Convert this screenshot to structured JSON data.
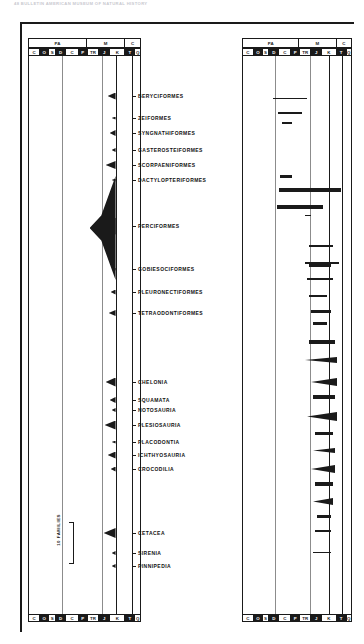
{
  "running_head": "48  BULLETIN AMERICAN MUSEUM OF NATURAL HISTORY",
  "scale_key": {
    "label": "10 FAMILIES"
  },
  "eras": [
    {
      "code": "PALEOZOIC",
      "short": "PA",
      "w": 46
    },
    {
      "code": "MESOZOIC",
      "short": "M",
      "w": 30
    },
    {
      "code": "CENOZOIC",
      "short": "C",
      "w": 12
    }
  ],
  "periods": [
    {
      "code": "C",
      "name": "Cambrian",
      "dark": false,
      "w": 9
    },
    {
      "code": "O",
      "name": "Ordovician",
      "dark": true,
      "w": 7
    },
    {
      "code": "S",
      "name": "Silurian",
      "dark": false,
      "w": 5
    },
    {
      "code": "D",
      "name": "Devonian",
      "dark": true,
      "w": 8
    },
    {
      "code": "C",
      "name": "Carboniferous",
      "dark": false,
      "w": 10
    },
    {
      "code": "P",
      "name": "Permian",
      "dark": true,
      "w": 7
    },
    {
      "code": "TR",
      "name": "Triassic",
      "dark": false,
      "w": 9
    },
    {
      "code": "J",
      "name": "Jurassic",
      "dark": true,
      "w": 9
    },
    {
      "code": "K",
      "name": "Cretaceous",
      "dark": false,
      "w": 12
    },
    {
      "code": "T",
      "name": "Tertiary",
      "dark": true,
      "w": 8
    },
    {
      "code": "Q",
      "name": "Quaternary",
      "dark": false,
      "w": 4
    }
  ],
  "chart_data": {
    "type": "area",
    "xlabel": "Geologic time (Cambrian – Quaternary)",
    "ylabel": "Taxonomic orders",
    "grid": false,
    "legend": "none",
    "units": "families",
    "scale_bar_families": 10,
    "panels": [
      {
        "name": "left-panel",
        "groups": [
          {
            "label": "BERYCIFORMES",
            "y": 96,
            "peak_families": 9,
            "start": "K",
            "end": "Q"
          },
          {
            "label": "ZEIFORMES",
            "y": 118,
            "peak_families": 2,
            "start": "K",
            "end": "Q"
          },
          {
            "label": "SYNGNATHIFORMES",
            "y": 133,
            "peak_families": 7,
            "start": "T",
            "end": "Q"
          },
          {
            "label": "GASTEROSTEIFORMES",
            "y": 150,
            "peak_families": 3,
            "start": "T",
            "end": "Q"
          },
          {
            "label": "SCORPAENIFORMES",
            "y": 165,
            "peak_families": 11,
            "start": "T",
            "end": "Q"
          },
          {
            "label": "DACTYLOPTERIFORMES",
            "y": 180,
            "peak_families": 2,
            "start": "T",
            "end": "Q"
          },
          {
            "label": "PERCIFORMES",
            "y": 226,
            "peak_families": 28,
            "start": "K",
            "end": "Q"
          },
          {
            "label": "GOBIESOCIFORMES",
            "y": 269,
            "peak_families": 2,
            "start": "T",
            "end": "Q"
          },
          {
            "label": "PLEURONECTIFORMES",
            "y": 292,
            "peak_families": 6,
            "start": "T",
            "end": "Q"
          },
          {
            "label": "TETRAODONTIFORMES",
            "y": 313,
            "peak_families": 8,
            "start": "T",
            "end": "Q"
          },
          {
            "label": "CHELONIA",
            "y": 382,
            "peak_families": 12,
            "start": "TR",
            "end": "Q"
          },
          {
            "label": "SQUAMATA",
            "y": 400,
            "peak_families": 7,
            "start": "J",
            "end": "Q"
          },
          {
            "label": "NOTOSAURIA",
            "y": 410,
            "peak_families": 3,
            "start": "TR",
            "end": "TR"
          },
          {
            "label": "PLESIOSAURIA",
            "y": 425,
            "peak_families": 13,
            "start": "TR",
            "end": "K"
          },
          {
            "label": "PLACODONTIA",
            "y": 442,
            "peak_families": 2,
            "start": "TR",
            "end": "TR"
          },
          {
            "label": "ICHTHYOSAURIA",
            "y": 455,
            "peak_families": 9,
            "start": "TR",
            "end": "K"
          },
          {
            "label": "CROCODILIA",
            "y": 469,
            "peak_families": 6,
            "start": "TR",
            "end": "Q"
          },
          {
            "label": "CETACEA",
            "y": 533,
            "peak_families": 14,
            "start": "T",
            "end": "Q"
          },
          {
            "label": "SIRENIA",
            "y": 553,
            "peak_families": 4,
            "start": "T",
            "end": "Q"
          },
          {
            "label": "PINNIPEDIA",
            "y": 566,
            "peak_families": 3,
            "start": "T",
            "end": "Q"
          }
        ]
      },
      {
        "name": "right-panel",
        "ranges": [
          {
            "y": 98,
            "x": 30,
            "w": 34,
            "weight": 1
          },
          {
            "y": 112,
            "x": 35,
            "w": 24,
            "weight": 2
          },
          {
            "y": 122,
            "x": 39,
            "w": 10,
            "weight": 2
          },
          {
            "y": 175,
            "x": 37,
            "w": 12,
            "weight": 3
          },
          {
            "y": 188,
            "x": 36,
            "w": 62,
            "weight": 4
          },
          {
            "y": 205,
            "x": 34,
            "w": 46,
            "weight": 4
          },
          {
            "y": 215,
            "x": 62,
            "w": 6,
            "weight": 1
          },
          {
            "y": 245,
            "x": 66,
            "w": 24,
            "weight": 2
          },
          {
            "y": 262,
            "x": 62,
            "w": 34,
            "weight": 2
          },
          {
            "y": 278,
            "x": 64,
            "w": 26,
            "weight": 2
          },
          {
            "y": 263,
            "x": 66,
            "w": 22,
            "weight": 4
          },
          {
            "y": 295,
            "x": 66,
            "w": 18,
            "weight": 2
          },
          {
            "y": 310,
            "x": 68,
            "w": 20,
            "weight": 3
          },
          {
            "y": 322,
            "x": 70,
            "w": 14,
            "weight": 3
          },
          {
            "y": 340,
            "x": 66,
            "w": 26,
            "weight": 4
          },
          {
            "y": 357,
            "x": 62,
            "w": 32,
            "weight": 6
          },
          {
            "y": 378,
            "x": 68,
            "w": 26,
            "weight": 8
          },
          {
            "y": 395,
            "x": 70,
            "w": 22,
            "weight": 4
          },
          {
            "y": 412,
            "x": 64,
            "w": 30,
            "weight": 9
          },
          {
            "y": 432,
            "x": 72,
            "w": 18,
            "weight": 3
          },
          {
            "y": 448,
            "x": 70,
            "w": 22,
            "weight": 5
          },
          {
            "y": 465,
            "x": 68,
            "w": 24,
            "weight": 8
          },
          {
            "y": 482,
            "x": 72,
            "w": 18,
            "weight": 4
          },
          {
            "y": 498,
            "x": 70,
            "w": 20,
            "weight": 7
          },
          {
            "y": 515,
            "x": 74,
            "w": 14,
            "weight": 3
          },
          {
            "y": 530,
            "x": 72,
            "w": 16,
            "weight": 2
          },
          {
            "y": 552,
            "x": 70,
            "w": 18,
            "weight": 1
          }
        ]
      }
    ]
  }
}
